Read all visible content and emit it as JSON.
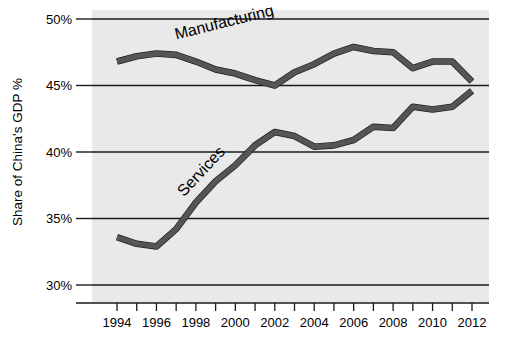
{
  "chart_data": {
    "type": "line",
    "title": "",
    "subtitle": "",
    "xlabel": "",
    "ylabel": "Share of China's GDP %",
    "xlim": [
      1993.2,
      2012.6
    ],
    "ylim": [
      28.0,
      50.8
    ],
    "grid": true,
    "gridlines_y": [
      30,
      35,
      40,
      45,
      50
    ],
    "legend_position": "inline-labels",
    "x": [
      1994,
      1995,
      1996,
      1997,
      1998,
      1999,
      2000,
      2001,
      2002,
      2003,
      2004,
      2005,
      2006,
      2007,
      2008,
      2009,
      2010,
      2011,
      2012
    ],
    "categories": [
      "1994",
      "1995",
      "1996",
      "1997",
      "1998",
      "1999",
      "2000",
      "2001",
      "2002",
      "2003",
      "2004",
      "2005",
      "2006",
      "2007",
      "2008",
      "2009",
      "2010",
      "2011",
      "2012"
    ],
    "series": [
      {
        "name": "Manufacturing",
        "color": "#555555",
        "values": [
          46.8,
          47.2,
          47.4,
          47.3,
          46.8,
          46.2,
          45.9,
          45.4,
          45.0,
          46.0,
          46.6,
          47.4,
          47.9,
          47.6,
          47.5,
          46.3,
          46.8,
          46.8,
          45.3
        ]
      },
      {
        "name": "Services",
        "color": "#555555",
        "values": [
          33.6,
          33.1,
          32.9,
          34.2,
          36.2,
          37.8,
          39.0,
          40.5,
          41.5,
          41.2,
          40.4,
          40.5,
          40.9,
          41.9,
          41.8,
          43.4,
          43.2,
          43.4,
          44.6
        ]
      }
    ],
    "y_ticks": [
      {
        "value": 30,
        "label": "30%"
      },
      {
        "value": 35,
        "label": "35%"
      },
      {
        "value": 40,
        "label": "40%"
      },
      {
        "value": 45,
        "label": "45%"
      },
      {
        "value": 50,
        "label": "50%"
      }
    ],
    "x_ticks": [
      {
        "value": 1994,
        "label": "1994"
      },
      {
        "value": 1995,
        "label": ""
      },
      {
        "value": 1996,
        "label": "1996"
      },
      {
        "value": 1997,
        "label": ""
      },
      {
        "value": 1998,
        "label": "1998"
      },
      {
        "value": 1999,
        "label": ""
      },
      {
        "value": 2000,
        "label": "2000"
      },
      {
        "value": 2001,
        "label": ""
      },
      {
        "value": 2002,
        "label": "2002"
      },
      {
        "value": 2003,
        "label": ""
      },
      {
        "value": 2004,
        "label": "2004"
      },
      {
        "value": 2005,
        "label": ""
      },
      {
        "value": 2006,
        "label": "2006"
      },
      {
        "value": 2007,
        "label": ""
      },
      {
        "value": 2008,
        "label": "2008"
      },
      {
        "value": 2009,
        "label": ""
      },
      {
        "value": 2010,
        "label": "2010"
      },
      {
        "value": 2011,
        "label": ""
      },
      {
        "value": 2012,
        "label": "2012"
      }
    ],
    "annotations": [
      {
        "name": "manufacturing-label",
        "text": "Manufacturing",
        "x": 1997.0,
        "y": 48.45,
        "rotation": -14
      },
      {
        "name": "services-label",
        "text": "Services",
        "x": 1997.4,
        "y": 36.6,
        "rotation": -47
      }
    ],
    "colors": {
      "plot_background": "#e9e9e9",
      "page_background": "#ffffff",
      "line": "#555555",
      "line_outline": "#1f1f1f",
      "grid": "#1a1a1a",
      "text": "#000000"
    }
  }
}
